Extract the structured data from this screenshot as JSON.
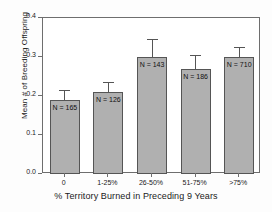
{
  "chart_data": {
    "type": "bar",
    "title": "",
    "xlabel": "% Territory Burned in Preceding 9 Years",
    "ylabel": "Mean # of Breeding Offspring",
    "categories": [
      "0",
      "1-25%",
      "26-50%",
      "51-75%",
      ">75%"
    ],
    "values": [
      0.19,
      0.21,
      0.3,
      0.27,
      0.3
    ],
    "errors": [
      0.025,
      0.025,
      0.045,
      0.035,
      0.025
    ],
    "point_labels": [
      "N = 165",
      "N = 126",
      "N = 143",
      "N = 186",
      "N = 710"
    ],
    "sample_sizes": [
      165,
      126,
      143,
      186,
      710
    ],
    "ylim": [
      0.0,
      0.4
    ],
    "ytick_labels": [
      "0.0",
      "0.1",
      "0.2",
      "0.3",
      "0.4"
    ],
    "ytick_values": [
      0.0,
      0.1,
      0.2,
      0.3,
      0.4
    ],
    "grid": false,
    "legend": "none",
    "bar_fill_color": "#b0b0b0",
    "bar_edge_color": "#555555",
    "axis_color": "#6e6e6e",
    "text_color": "#1a1a1a"
  }
}
